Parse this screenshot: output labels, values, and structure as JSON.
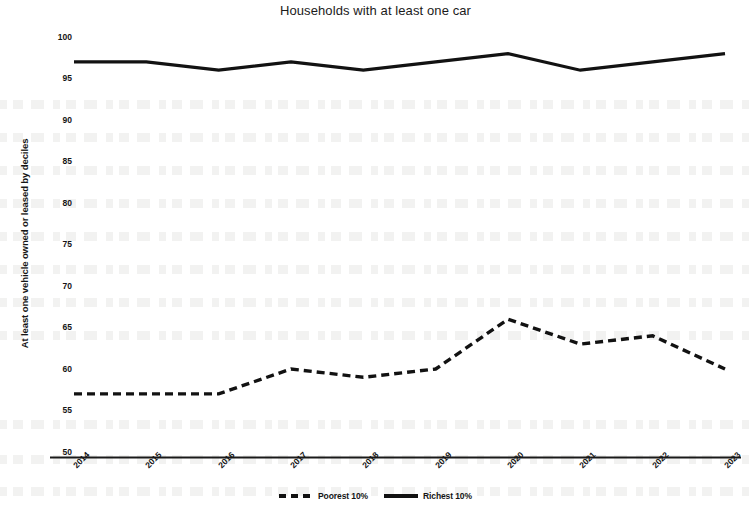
{
  "chart_data": {
    "type": "line",
    "title": "Households with at least one car",
    "xlabel": "",
    "ylabel": "At least one vehicle owned or leased by deciles",
    "categories": [
      "2014",
      "2015",
      "2016",
      "2017",
      "2018",
      "2019",
      "2020",
      "2021",
      "2022",
      "2023"
    ],
    "ylim": [
      50,
      100
    ],
    "yticks": [
      "50",
      "55",
      "60",
      "65",
      "70",
      "75",
      "80",
      "85",
      "90",
      "95",
      "100"
    ],
    "ytick_values": [
      50,
      55,
      60,
      65,
      70,
      75,
      80,
      85,
      90,
      95,
      100
    ],
    "grid": false,
    "legend_position": "bottom",
    "series": [
      {
        "name": "Poorest 10%",
        "style": "dashed",
        "color": "#111111",
        "values": [
          57,
          57,
          57,
          60,
          59,
          60,
          66,
          63,
          64,
          60
        ]
      },
      {
        "name": "Richest 10%",
        "style": "solid",
        "color": "#111111",
        "values": [
          97,
          97,
          96,
          97,
          96,
          97,
          98,
          96,
          97,
          98
        ]
      }
    ]
  },
  "legend": {
    "items": [
      {
        "label": "Poorest 10%",
        "style": "dashed"
      },
      {
        "label": "Richest 10%",
        "style": "solid"
      }
    ]
  }
}
